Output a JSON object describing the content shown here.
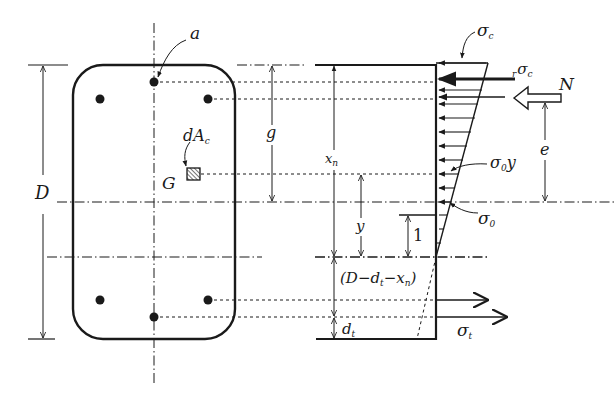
{
  "figure": {
    "title": "",
    "colors": {
      "ink": "#1a1a1a",
      "background": "#ffffff"
    }
  },
  "section": {
    "rebars": {
      "top_count": 3,
      "bottom_count": 3
    },
    "labels": {
      "rebar": "a",
      "area_element": "dA",
      "area_element_sub": "c",
      "centroid": "G",
      "depth": "D"
    }
  },
  "stress_diagram": {
    "labels": {
      "sigma_c": "σ",
      "sigma_c_sub": "c",
      "r_sigma_c_pre": "r",
      "r_sigma_c": "σ",
      "r_sigma_c_sub": "c",
      "axial_force": "N",
      "eccentricity": "e",
      "sigma_0y": "σ",
      "sigma_0y_sub": "0",
      "sigma_0y_tail": "y",
      "sigma_0": "σ",
      "sigma_0_sub": "0",
      "sigma_t": "σ",
      "sigma_t_sub": "t",
      "unit_height": "1"
    },
    "dimensions": {
      "g": "g",
      "xn": "x",
      "xn_sub": "n",
      "y": "y",
      "tension_zone": "(D−d",
      "tension_zone_sub1": "t",
      "tension_zone_mid": "−x",
      "tension_zone_sub2": "n",
      "tension_zone_end": ")",
      "dt": "d",
      "dt_sub": "t"
    }
  }
}
